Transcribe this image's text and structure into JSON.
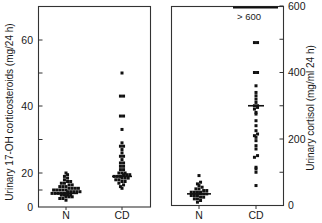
{
  "chart_data": [
    {
      "type": "scatter",
      "subtype": "dot-plot",
      "title": "",
      "xlabel": "",
      "ylabel": "Urinary 17-OH corticosteroids (mg/24 h)",
      "categories": [
        "N",
        "CD"
      ],
      "yticks": [
        0,
        20,
        40,
        60
      ],
      "ylim": [
        0,
        70
      ],
      "grid": false,
      "series": [
        {
          "name": "N",
          "values": [
            4,
            5,
            5,
            6,
            6,
            6,
            7,
            7,
            7,
            7,
            8,
            8,
            8,
            8,
            8,
            9,
            9,
            9,
            9,
            9,
            10,
            10,
            10,
            10,
            10,
            11,
            11,
            11,
            11,
            12,
            12,
            12,
            13,
            13,
            14,
            14,
            15,
            15,
            16,
            17,
            18,
            19,
            20
          ],
          "median": 8
        },
        {
          "name": "CD",
          "values": [
            11,
            12,
            13,
            14,
            15,
            15,
            16,
            16,
            17,
            17,
            17,
            18,
            18,
            18,
            19,
            19,
            19,
            20,
            20,
            20,
            21,
            21,
            22,
            22,
            23,
            23,
            24,
            25,
            25,
            26,
            27,
            28,
            28,
            29,
            33,
            37,
            37,
            43,
            43,
            50
          ],
          "median": 18
        }
      ]
    },
    {
      "type": "scatter",
      "subtype": "dot-plot",
      "title": "",
      "xlabel": "",
      "ylabel": "Urinary cortisol (mg/ml 24 h)",
      "categories": [
        "N",
        "CD"
      ],
      "yticks": [
        0,
        200,
        400,
        600
      ],
      "ylim": [
        0,
        600
      ],
      "grid": false,
      "annotation": "> 600",
      "series": [
        {
          "name": "N",
          "values": [
            10,
            15,
            20,
            20,
            25,
            25,
            30,
            30,
            30,
            35,
            35,
            35,
            40,
            40,
            40,
            40,
            45,
            45,
            50,
            50,
            55,
            60,
            65,
            70,
            90
          ],
          "median": 35
        },
        {
          "name": "CD",
          "values": [
            60,
            100,
            110,
            115,
            145,
            150,
            170,
            180,
            195,
            205,
            210,
            215,
            225,
            240,
            255,
            275,
            280,
            290,
            295,
            300,
            300,
            310,
            320,
            330,
            340,
            360,
            400,
            400,
            490,
            490,
            600,
            600,
            600,
            600,
            600,
            600,
            600,
            600,
            600,
            600,
            600,
            600,
            600,
            600,
            600
          ],
          "median": 300
        }
      ]
    }
  ],
  "left_panel": {
    "ylabel": "Urinary 17-OH corticosteroids (mg/24 h)",
    "ticks": [
      "0",
      "20",
      "40",
      "60"
    ],
    "xcat_n": "N",
    "xcat_cd": "CD"
  },
  "right_panel": {
    "ylabel": "Urinary cortisol (mg/ml 24 h)",
    "ticks": [
      "0",
      "200",
      "400",
      "600"
    ],
    "annotation": "> 600",
    "xcat_n": "N",
    "xcat_cd": "CD"
  }
}
